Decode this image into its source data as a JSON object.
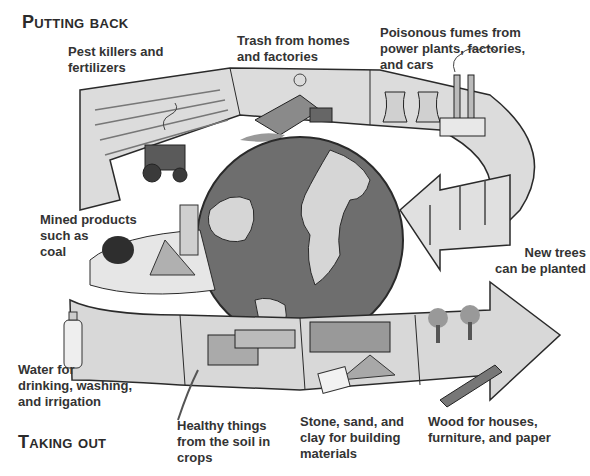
{
  "titles": {
    "putting_back": "Putting back",
    "taking_out": "Taking out"
  },
  "putting_back_items": [
    {
      "label": "Pest killers and\nfertilizers"
    },
    {
      "label": "Trash from homes\nand factories"
    },
    {
      "label": "Poisonous fumes from\npower plants, factories,\nand cars"
    },
    {
      "label": "New trees\ncan be planted"
    }
  ],
  "taking_out_items": [
    {
      "label": "Mined products\nsuch as\ncoal"
    },
    {
      "label": "Water for\ndrinking, washing,\nand irrigation"
    },
    {
      "label": "Healthy things\nfrom the soil in\ncrops"
    },
    {
      "label": "Stone, sand, and\nclay for building\nmaterials"
    },
    {
      "label": "Wood for houses,\nfurniture, and paper"
    }
  ],
  "colors": {
    "ribbon_light": "#e4e4e4",
    "ribbon_mid": "#c8c8c8",
    "ocean": "#6e6e6e",
    "land": "#d6d6d6",
    "outline": "#2a2a2a",
    "text": "#333333"
  }
}
